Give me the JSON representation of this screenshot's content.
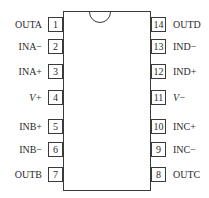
{
  "diagram": {
    "type": "ic-pinout",
    "package": "14-pin DIP",
    "left_pins": [
      {
        "number": "1",
        "label": "OUTA",
        "top": 17
      },
      {
        "number": "2",
        "label": "INA−",
        "top": 39
      },
      {
        "number": "3",
        "label": "INA+",
        "top": 64
      },
      {
        "number": "4",
        "label": "V+",
        "top": 90
      },
      {
        "number": "5",
        "label": "INB+",
        "top": 119
      },
      {
        "number": "6",
        "label": "INB−",
        "top": 142
      },
      {
        "number": "7",
        "label": "OUTB",
        "top": 167
      }
    ],
    "right_pins": [
      {
        "number": "14",
        "label": "OUTD",
        "top": 17
      },
      {
        "number": "13",
        "label": "IND−",
        "top": 39
      },
      {
        "number": "12",
        "label": "IND+",
        "top": 64
      },
      {
        "number": "11",
        "label": "V−",
        "top": 90
      },
      {
        "number": "10",
        "label": "INC+",
        "top": 119
      },
      {
        "number": "9",
        "label": "INC−",
        "top": 142
      },
      {
        "number": "8",
        "label": "OUTC",
        "top": 167
      }
    ]
  }
}
